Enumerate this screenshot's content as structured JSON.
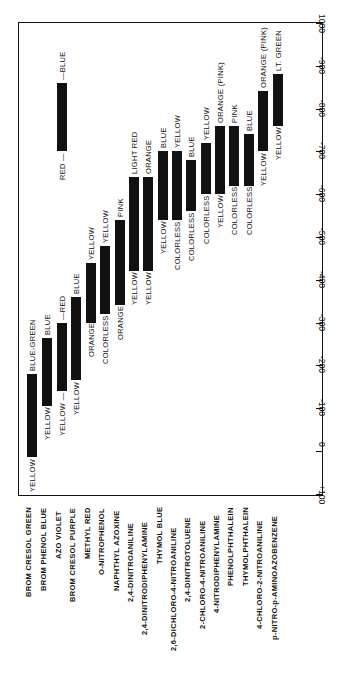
{
  "chart_data": {
    "type": "bar",
    "orientation": "floating range bars, figure rotated 90 degrees",
    "title": "",
    "xlabel": "",
    "ylabel": "",
    "axis_ticks": [
      "+100",
      "0",
      "-100",
      "-200",
      "-300",
      "-400",
      "-500",
      "-600",
      "-700",
      "-800",
      "-900",
      "-1000"
    ],
    "ylim": [
      100,
      -1000
    ],
    "grid": false,
    "categories": [
      "BROM CRESOL GREEN",
      "BROM PHENOL BLUE",
      "AZO VIOLET",
      "BROM CRESOL PURPLE",
      "METHYL RED",
      "O-NITROPHENOL",
      "NAPHTHYL AZOXINE",
      "2,4-DINITROANILINE",
      "2,4-DINITRODIPHENYLAMINE",
      "THYMOL BLUE",
      "2,6-DICHLORO-4-NITROANILINE",
      "2,4-DINITROTOLUENE",
      "2-CHLORO-4-NITROANILINE",
      "4-NITRODIPHENYLAMINE",
      "PHENOLPHTHALEIN",
      "THYMOLPHTHALEIN",
      "4-CHLORO-2-NITROANILINE",
      "p-NITRO-p-AMINOAZOBENZENE"
    ],
    "ranges": [
      {
        "name": "BROM CRESOL GREEN",
        "start": 15,
        "end": -180,
        "low_color": "YELLOW",
        "high_color": "BLUE-GREEN"
      },
      {
        "name": "BROM PHENOL BLUE",
        "start": -105,
        "end": -265,
        "low_color": "YELLOW",
        "high_color": "BLUE"
      },
      {
        "name": "AZO VIOLET",
        "start": -140,
        "end": -300,
        "low_color": "YELLOW —",
        "high_color": "—RED"
      },
      {
        "name": "AZO VIOLET (2)",
        "start": -700,
        "end": -860,
        "low_color": "RED —",
        "high_color": "—BLUE"
      },
      {
        "name": "BROM CRESOL PURPLE",
        "start": -165,
        "end": -360,
        "low_color": "YELLOW",
        "high_color": "BLUE"
      },
      {
        "name": "METHYL RED",
        "start": -300,
        "end": -440,
        "low_color": "ORANGE",
        "high_color": "YELLOW"
      },
      {
        "name": "O-NITROPHENOL",
        "start": -320,
        "end": -480,
        "low_color": "COLORLESS",
        "high_color": "YELLOW"
      },
      {
        "name": "NAPHTHYL AZOXINE",
        "start": -340,
        "end": -540,
        "low_color": "ORANGE",
        "high_color": "PINK"
      },
      {
        "name": "2,4-DINITROANILINE",
        "start": -420,
        "end": -640,
        "low_color": "YELLOW",
        "high_color": "LIGHT RED"
      },
      {
        "name": "2,4-DINITRODIPHENYLAMINE",
        "start": -420,
        "end": -640,
        "low_color": "YELLOW",
        "high_color": "ORANGE"
      },
      {
        "name": "THYMOL BLUE",
        "start": -540,
        "end": -700,
        "low_color": "YELLOW",
        "high_color": "BLUE"
      },
      {
        "name": "2,6-DICHLORO-4-NITROANILINE",
        "start": -540,
        "end": -700,
        "low_color": "COLORLESS",
        "high_color": "YELLOW"
      },
      {
        "name": "2,4-DINITROTOLUENE",
        "start": -560,
        "end": -680,
        "low_color": "COLORLESS",
        "high_color": "BLUE"
      },
      {
        "name": "2-CHLORO-4-NITROANILINE",
        "start": -600,
        "end": -720,
        "low_color": "COLORLESS",
        "high_color": "YELLOW"
      },
      {
        "name": "4-NITRODIPHENYLAMINE",
        "start": -600,
        "end": -760,
        "low_color": "YELLOW",
        "high_color": "ORANGE (PINK)"
      },
      {
        "name": "PHENOLPHTHALEIN",
        "start": -620,
        "end": -760,
        "low_color": "COLORLESS",
        "high_color": "PINK"
      },
      {
        "name": "THYMOLPHTHALEIN",
        "start": -620,
        "end": -740,
        "low_color": "COLORLESS",
        "high_color": "BLUE"
      },
      {
        "name": "4-CHLORO-2-NITROANILINE",
        "start": -700,
        "end": -840,
        "low_color": "YELLOW",
        "high_color": "ORANGE (PINK)"
      },
      {
        "name": "p-NITRO-p-AMINOAZOBENZENE",
        "start": -760,
        "end": -880,
        "low_color": "YELLOW",
        "high_color": "LT. GREEN"
      }
    ]
  },
  "labels": {
    "ticks": [
      "+100",
      "0",
      "-100",
      "-200",
      "-300",
      "-400",
      "-500",
      "-600",
      "-700",
      "-800",
      "-900",
      "1000"
    ]
  }
}
